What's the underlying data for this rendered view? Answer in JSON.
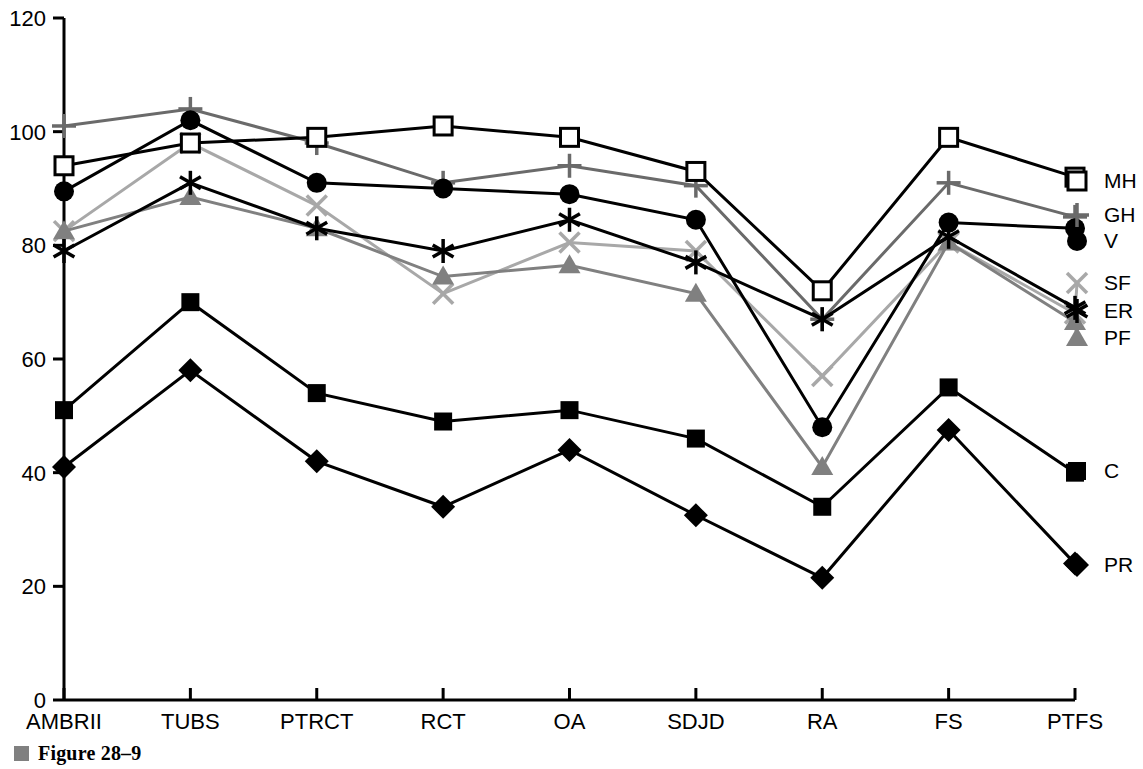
{
  "figure": {
    "caption": "Figure 28–9",
    "bullet_color": "#808080"
  },
  "chart_data": {
    "type": "line",
    "title": "",
    "xlabel": "",
    "ylabel": "",
    "ylim": [
      0,
      120
    ],
    "yticks": [
      0,
      20,
      40,
      60,
      80,
      100,
      120
    ],
    "grid": false,
    "legend_position": "right",
    "categories": [
      "AMBRII",
      "TUBS",
      "PTRCT",
      "RCT",
      "OA",
      "SDJD",
      "RA",
      "FS",
      "PTFS"
    ],
    "series": [
      {
        "name": "MH",
        "marker": "open-square",
        "color": "#000000",
        "values": [
          94,
          98,
          99,
          101,
          99,
          93,
          72,
          99,
          92
        ]
      },
      {
        "name": "GH",
        "marker": "plus",
        "color": "#6a6a6a",
        "values": [
          101,
          104,
          98,
          91,
          94,
          90.5,
          67,
          91,
          85
        ]
      },
      {
        "name": "V",
        "marker": "filled-circle",
        "color": "#000000",
        "values": [
          89.5,
          102,
          91,
          90,
          89,
          84.5,
          48,
          84,
          83
        ]
      },
      {
        "name": "SF",
        "marker": "cross-x",
        "color": "#a8a8a8",
        "values": [
          82.5,
          98,
          87,
          71.5,
          80.5,
          79,
          57,
          80.5,
          68
        ]
      },
      {
        "name": "ER",
        "marker": "asterisk",
        "color": "#000000",
        "values": [
          79,
          91,
          83,
          79,
          84.5,
          77,
          67,
          81.5,
          69
        ]
      },
      {
        "name": "PF",
        "marker": "filled-triangle",
        "color": "#808080",
        "values": [
          82.5,
          88.5,
          83,
          74.5,
          76.5,
          71.5,
          41,
          80.5,
          66.5
        ]
      },
      {
        "name": "C",
        "marker": "filled-square",
        "color": "#000000",
        "values": [
          51,
          70,
          54,
          49,
          51,
          46,
          34,
          55,
          40
        ]
      },
      {
        "name": "PR",
        "marker": "filled-diamond",
        "color": "#000000",
        "values": [
          41,
          58,
          42,
          34,
          44,
          32.5,
          21.5,
          47.5,
          24
        ]
      }
    ],
    "legend_entries": [
      {
        "label": "MH",
        "x": 1104,
        "y": 188
      },
      {
        "label": "GH",
        "x": 1104,
        "y": 222
      },
      {
        "label": "V",
        "x": 1104,
        "y": 248
      },
      {
        "label": "SF",
        "x": 1104,
        "y": 290
      },
      {
        "label": "ER",
        "x": 1104,
        "y": 318
      },
      {
        "label": "PF",
        "x": 1104,
        "y": 345
      },
      {
        "label": "C",
        "x": 1104,
        "y": 478
      },
      {
        "label": "PR",
        "x": 1104,
        "y": 572
      }
    ]
  }
}
